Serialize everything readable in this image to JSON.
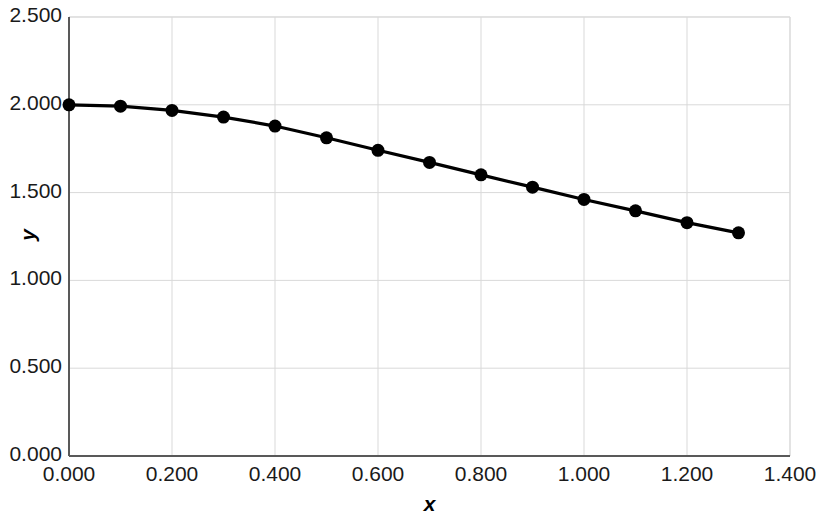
{
  "chart_data": {
    "type": "line",
    "title": "",
    "subtitle": "",
    "xlabel": "x",
    "ylabel": "y",
    "xlim": [
      0.0,
      1.4
    ],
    "ylim": [
      0.0,
      2.5
    ],
    "xticks": [
      "0.000",
      "0.200",
      "0.400",
      "0.600",
      "0.800",
      "1.000",
      "1.200",
      "1.400"
    ],
    "xtick_values": [
      0.0,
      0.2,
      0.4,
      0.6,
      0.8,
      1.0,
      1.2,
      1.4
    ],
    "yticks": [
      "0.000",
      "0.500",
      "1.000",
      "1.500",
      "2.000",
      "2.500"
    ],
    "ytick_values": [
      0.0,
      0.5,
      1.0,
      1.5,
      2.0,
      2.5
    ],
    "grid": true,
    "legend": "none",
    "marker": "filled-circle",
    "line_color": "#000000",
    "marker_color": "#000000",
    "grid_color": "#d9d9d9",
    "axis_color": "#595959",
    "background": "#ffffff",
    "x": [
      0.0,
      0.1,
      0.2,
      0.3,
      0.4,
      0.5,
      0.6,
      0.7,
      0.8,
      0.9,
      1.0,
      1.1,
      1.2,
      1.3
    ],
    "values": [
      2.0,
      1.992,
      1.968,
      1.93,
      1.879,
      1.812,
      1.741,
      1.672,
      1.601,
      1.531,
      1.461,
      1.396,
      1.329,
      1.271
    ],
    "series": [
      {
        "name": "y",
        "values": [
          2.0,
          1.992,
          1.968,
          1.93,
          1.879,
          1.812,
          1.741,
          1.672,
          1.601,
          1.531,
          1.461,
          1.396,
          1.329,
          1.271
        ]
      }
    ]
  }
}
